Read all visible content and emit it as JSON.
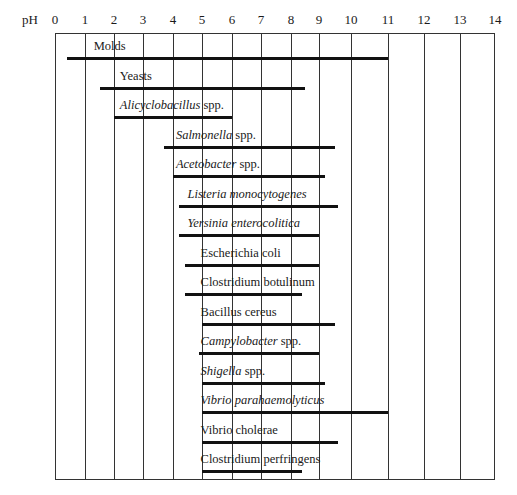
{
  "chart_data": {
    "type": "bar",
    "orientation": "horizontal-range",
    "title": "",
    "xlabel": "pH",
    "ylabel": "",
    "xlim": [
      0,
      14
    ],
    "x_ticks": [
      "0",
      "1",
      "2",
      "3",
      "4",
      "5",
      "6",
      "7",
      "8",
      "9",
      "10",
      "11",
      "12",
      "13",
      "14"
    ],
    "grid": true,
    "legend": null,
    "categories": [
      "Molds",
      "Yeasts",
      "Alicyclobacillus spp.",
      "Salmonella spp.",
      "Acetobacter spp.",
      "Listeria monocytogenes",
      "Yersinia enterocolitica",
      "Escherichia coli",
      "Clostridium botulinum",
      "Bacillus cereus",
      "Campylobacter spp.",
      "Shigella spp.",
      "Vibrio parahaemolyticus",
      "Vibrio cholerae",
      "Clostridium perfringens"
    ],
    "series": [
      {
        "name": "pH min",
        "values": [
          0.4,
          1.5,
          2.0,
          3.7,
          4.0,
          4.2,
          4.2,
          4.4,
          4.4,
          5.0,
          4.9,
          5.0,
          5.0,
          5.0,
          5.0
        ]
      },
      {
        "name": "pH max",
        "values": [
          11.0,
          8.5,
          6.0,
          9.5,
          9.2,
          9.6,
          9.0,
          9.0,
          8.4,
          9.5,
          9.0,
          9.2,
          11.0,
          9.6,
          8.4
        ]
      }
    ],
    "rows": [
      {
        "label": "Molds",
        "italic_part": "",
        "rest": "Molds",
        "min": 0.4,
        "max": 11.0,
        "label_x": 1.3
      },
      {
        "label": "Yeasts",
        "italic_part": "",
        "rest": "Yeasts",
        "min": 1.5,
        "max": 8.5,
        "label_x": 2.2
      },
      {
        "label": "Alicyclobacillus spp.",
        "italic_part": "Alicyclobacillus",
        "rest": " spp.",
        "min": 2.0,
        "max": 6.0,
        "label_x": 2.2
      },
      {
        "label": "Salmonella spp.",
        "italic_part": "Salmonella",
        "rest": " spp.",
        "min": 3.7,
        "max": 9.5,
        "label_x": 4.1
      },
      {
        "label": "Acetobacter spp.",
        "italic_part": "Acetobacter",
        "rest": " spp.",
        "min": 4.0,
        "max": 9.2,
        "label_x": 4.1
      },
      {
        "label": "Listeria monocytogenes",
        "italic_part": "Listeria monocytogenes",
        "rest": "",
        "min": 4.2,
        "max": 9.6,
        "label_x": 4.5
      },
      {
        "label": "Yersinia enterocolitica",
        "italic_part": "Yersinia enterocolitica",
        "rest": "",
        "min": 4.2,
        "max": 9.0,
        "label_x": 4.5
      },
      {
        "label": "Escherichia coli",
        "italic_part": "",
        "rest": "Escherichia coli",
        "min": 4.4,
        "max": 9.0,
        "label_x": 4.95
      },
      {
        "label": "Clostridium botulinum",
        "italic_part": "",
        "rest": "Clostridium botulinum",
        "min": 4.4,
        "max": 8.4,
        "label_x": 4.95
      },
      {
        "label": "Bacillus cereus",
        "italic_part": "",
        "rest": "Bacillus cereus",
        "min": 5.0,
        "max": 9.5,
        "label_x": 4.95
      },
      {
        "label": "Campylobacter spp.",
        "italic_part": "Campylobacter",
        "rest": " spp.",
        "min": 4.9,
        "max": 9.0,
        "label_x": 4.95
      },
      {
        "label": "Shigella spp.",
        "italic_part": "Shigella",
        "rest": " spp.",
        "min": 5.0,
        "max": 9.2,
        "label_x": 4.95
      },
      {
        "label": "Vibrio parahaemolyticus",
        "italic_part": "Vibrio parahaemolyticus",
        "rest": "",
        "min": 5.0,
        "max": 11.0,
        "label_x": 4.95
      },
      {
        "label": "Vibrio cholerae",
        "italic_part": "",
        "rest": "Vibrio cholerae",
        "min": 5.0,
        "max": 9.6,
        "label_x": 4.95
      },
      {
        "label": "Clostridium perfringens",
        "italic_part": "",
        "rest": "Clostridium perfringens",
        "min": 5.0,
        "max": 8.4,
        "label_x": 4.95
      }
    ]
  },
  "axis": {
    "ph_label": "pH",
    "grid_px": [
      55,
      85,
      114,
      143,
      173,
      202,
      232,
      261,
      291,
      319,
      351,
      388,
      424,
      460,
      495
    ]
  },
  "colors": {
    "bar": "#111111",
    "grid": "#333333",
    "background": "#ffffff"
  }
}
